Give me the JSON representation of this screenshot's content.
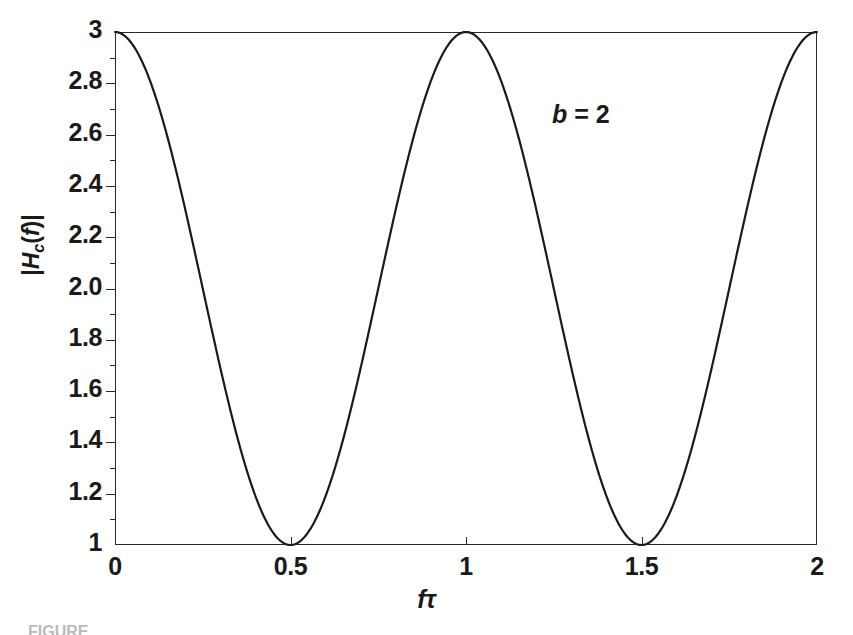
{
  "figure": {
    "annotation": "b = 2",
    "annotation_var": "b",
    "annotation_rest": " = 2",
    "caption": "FIGURE"
  },
  "axes": {
    "ylabel_open": "|",
    "ylabel_H": "H",
    "ylabel_sub": "c",
    "ylabel_paren_open": "(",
    "ylabel_f": "f",
    "ylabel_paren_close": ")",
    "ylabel_close": "|",
    "xlabel": "fτ",
    "y_ticks": [
      "1",
      "1.2",
      "1.4",
      "1.6",
      "1.8",
      "2.0",
      "2.2",
      "2.4",
      "2.6",
      "2.8",
      "3"
    ],
    "x_ticks": [
      "0",
      "0.5",
      "1",
      "1.5",
      "2"
    ]
  },
  "chart_data": {
    "type": "line",
    "title": "",
    "xlabel": "fτ",
    "ylabel": "|Hc(f)|",
    "xlim": [
      0,
      2
    ],
    "ylim": [
      1,
      3
    ],
    "grid": false,
    "legend": null,
    "annotations": [
      {
        "text": "b = 2",
        "x": 1.26,
        "y": 2.72
      }
    ],
    "xticks": [
      0,
      0.5,
      1,
      1.5,
      2
    ],
    "xticklabels": [
      "0",
      "0.5",
      "1",
      "1.5",
      "2"
    ],
    "yticks": [
      1,
      1.2,
      1.4,
      1.6,
      1.8,
      2.0,
      2.2,
      2.4,
      2.6,
      2.8,
      3
    ],
    "yticklabels": [
      "1",
      "1.2",
      "1.4",
      "1.6",
      "1.8",
      "2.0",
      "2.2",
      "2.4",
      "2.6",
      "2.8",
      "3"
    ],
    "yminorticks": [
      1.1,
      1.3,
      1.5,
      1.7,
      1.9,
      2.1,
      2.3,
      2.5,
      2.7,
      2.9
    ],
    "series": [
      {
        "name": "|Hc(f)|, b = 2",
        "formula": "2 + cos(2*pi*f*tau)",
        "color": "#1a1a1a",
        "linewidth": 2.2,
        "x": [
          0,
          0.05,
          0.1,
          0.15,
          0.2,
          0.25,
          0.3,
          0.35,
          0.4,
          0.45,
          0.5,
          0.55,
          0.6,
          0.65,
          0.7,
          0.75,
          0.8,
          0.85,
          0.9,
          0.95,
          1.0,
          1.05,
          1.1,
          1.15,
          1.2,
          1.25,
          1.3,
          1.35,
          1.4,
          1.45,
          1.5,
          1.55,
          1.6,
          1.65,
          1.7,
          1.75,
          1.8,
          1.85,
          1.9,
          1.95,
          2.0
        ],
        "y": [
          3.0,
          2.951,
          2.809,
          2.588,
          2.309,
          2.0,
          1.691,
          1.412,
          1.191,
          1.049,
          1.0,
          1.049,
          1.191,
          1.412,
          1.691,
          2.0,
          2.309,
          2.588,
          2.809,
          2.951,
          3.0,
          2.951,
          2.809,
          2.588,
          2.309,
          2.0,
          1.691,
          1.412,
          1.191,
          1.049,
          1.0,
          1.049,
          1.191,
          1.412,
          1.691,
          2.0,
          2.309,
          2.588,
          2.809,
          2.951,
          3.0
        ]
      }
    ],
    "maxima": [
      {
        "x": 0,
        "y": 3
      },
      {
        "x": 1,
        "y": 3
      },
      {
        "x": 2,
        "y": 3
      }
    ],
    "minima": [
      {
        "x": 0.5,
        "y": 1
      },
      {
        "x": 1.5,
        "y": 1
      }
    ]
  }
}
